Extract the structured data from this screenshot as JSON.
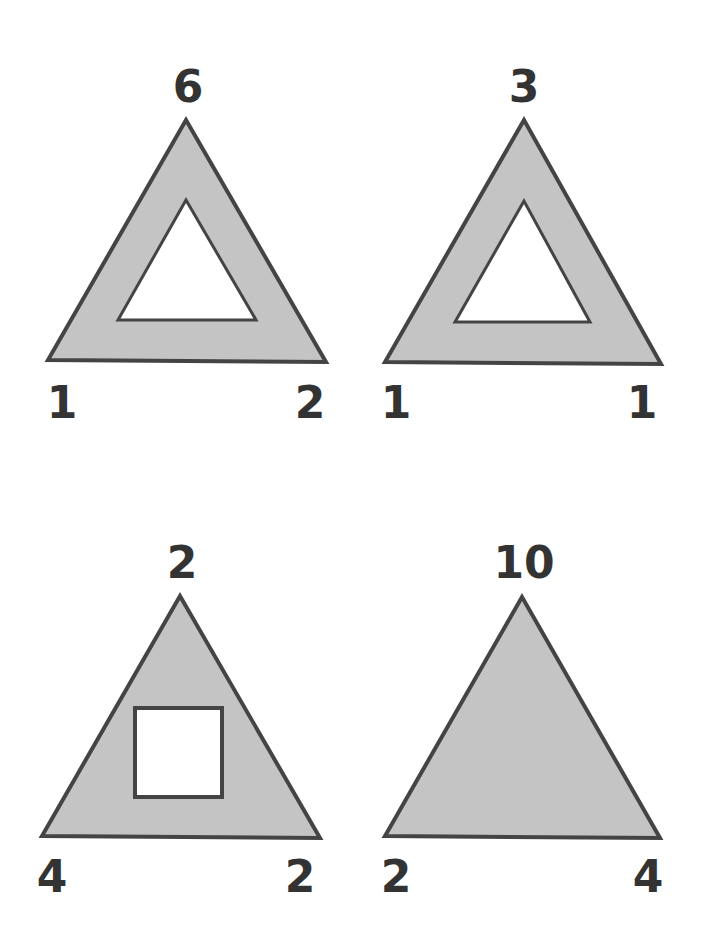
{
  "puzzle": {
    "colors": {
      "fill": "#c4c4c4",
      "stroke": "#444444",
      "inner": "#ffffff",
      "text": "#333333"
    },
    "figures": [
      {
        "id": "top-left",
        "top": "6",
        "left": "1",
        "right": "2",
        "inner_shape": "triangle"
      },
      {
        "id": "top-right",
        "top": "3",
        "left": "1",
        "right": "1",
        "inner_shape": "triangle"
      },
      {
        "id": "bottom-left",
        "top": "2",
        "left": "4",
        "right": "2",
        "inner_shape": "square"
      },
      {
        "id": "bottom-right",
        "top": "10",
        "left": "2",
        "right": "4",
        "inner_shape": "none"
      }
    ]
  }
}
